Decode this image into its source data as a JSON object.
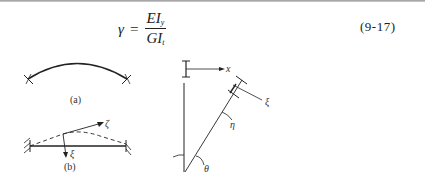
{
  "equation": {
    "lhs": "γ",
    "equals": "=",
    "numerator": {
      "main": "EI",
      "sub": "y"
    },
    "denominator": {
      "main": "GI",
      "sub": "t"
    },
    "number": "(9-17)"
  },
  "figures": {
    "a": {
      "caption": "(a)"
    },
    "b": {
      "caption": "(b)",
      "labels": {
        "zeta": "ζ",
        "xi": "ξ"
      }
    },
    "c": {
      "labels": {
        "x": "x",
        "xi": "ξ",
        "eta": "η",
        "theta": "θ"
      }
    }
  }
}
